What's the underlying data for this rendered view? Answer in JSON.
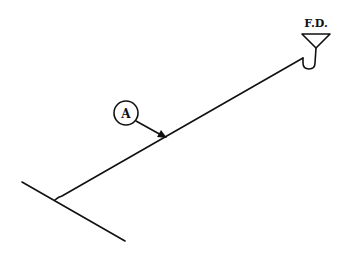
{
  "diagram": {
    "type": "plumbing-isometric",
    "fixture_label": "F.D.",
    "fixture_name": "floor drain",
    "callout_label": "A",
    "elements": [
      "main-pipe",
      "branch-pipe",
      "p-trap",
      "floor-drain-funnel",
      "callout-A"
    ],
    "colors": {
      "line": "#111111",
      "background": "#ffffff"
    }
  }
}
